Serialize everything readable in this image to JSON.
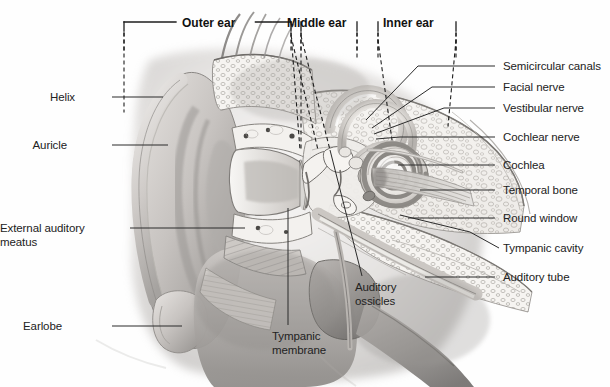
{
  "figure": {
    "background_color": "#fefefe",
    "ink_color": "#222222",
    "line_color": "#3a3a3a"
  },
  "brackets": [
    {
      "id": "outer-ear",
      "label": "Outer ear",
      "x1": 124,
      "x2": 291,
      "label_x": 182,
      "label_y": 16
    },
    {
      "id": "middle-ear",
      "label": "Middle ear",
      "x1": 301,
      "x2": 357,
      "label_x": 287,
      "label_y": 16
    },
    {
      "id": "inner-ear",
      "label": "Inner ear",
      "x1": 378,
      "x2": 456,
      "label_x": 383,
      "label_y": 16
    }
  ],
  "labels_left": [
    {
      "id": "helix",
      "text": "Helix",
      "text_x": 75,
      "text_y": 91,
      "lead_x1": 112,
      "lead_y1": 97,
      "lead_x2": 163,
      "lead_y2": 97
    },
    {
      "id": "auricle",
      "text": "Auricle",
      "text_x": 67,
      "text_y": 139,
      "lead_x1": 112,
      "lead_y1": 145,
      "lead_x2": 168,
      "lead_y2": 145
    },
    {
      "id": "external-auditory-meatus",
      "text": "External auditory\nmeatus",
      "text_x": 22,
      "text_y": 222,
      "lead_x1": 130,
      "lead_y1": 228,
      "lead_x2": 245,
      "lead_y2": 228
    },
    {
      "id": "earlobe",
      "text": "Earlobe",
      "text_x": 62,
      "text_y": 320,
      "lead_x1": 112,
      "lead_y1": 326,
      "lead_x2": 182,
      "lead_y2": 326
    }
  ],
  "labels_right": [
    {
      "id": "semicircular-canals",
      "text": "Semicircular canals",
      "text_x": 503,
      "text_y": 60,
      "lead_x1": 495,
      "lead_y1": 66,
      "lead_x2": 418,
      "lead_y2": 66,
      "lead_x3": 366,
      "lead_y3": 120
    },
    {
      "id": "facial-nerve",
      "text": "Facial nerve",
      "text_x": 503,
      "text_y": 81,
      "lead_x1": 495,
      "lead_y1": 87,
      "lead_x2": 432,
      "lead_y2": 87,
      "lead_x3": 372,
      "lead_y3": 128
    },
    {
      "id": "vestibular-nerve",
      "text": "Vestibular nerve",
      "text_x": 503,
      "text_y": 102,
      "lead_x1": 495,
      "lead_y1": 108,
      "lead_x2": 444,
      "lead_y2": 108,
      "lead_x3": 374,
      "lead_y3": 134
    },
    {
      "id": "cochlear-nerve",
      "text": "Cochlear nerve",
      "text_x": 503,
      "text_y": 131,
      "lead_x1": 495,
      "lead_y1": 137,
      "lead_x2": 400,
      "lead_y2": 137,
      "lead_x3": 376,
      "lead_y3": 139
    },
    {
      "id": "cochlea",
      "text": "Cochlea",
      "text_x": 503,
      "text_y": 159,
      "lead_x1": 495,
      "lead_y1": 165,
      "lead_x2": 398,
      "lead_y2": 165,
      "lead_x3": 398,
      "lead_y3": 165
    },
    {
      "id": "temporal-bone",
      "text": "Temporal bone",
      "text_x": 503,
      "text_y": 184,
      "lead_x1": 495,
      "lead_y1": 190,
      "lead_x2": 420,
      "lead_y2": 190,
      "lead_x3": 420,
      "lead_y3": 190
    },
    {
      "id": "round-window",
      "text": "Round window",
      "text_x": 503,
      "text_y": 212,
      "lead_x1": 495,
      "lead_y1": 218,
      "lead_x2": 408,
      "lead_y2": 218,
      "lead_x3": 408,
      "lead_y3": 218
    },
    {
      "id": "tympanic-cavity",
      "text": "Tympanic cavity",
      "text_x": 503,
      "text_y": 242,
      "lead_x1": 499,
      "lead_y1": 248,
      "lead_x2": 470,
      "lead_y2": 232,
      "lead_x3": 400,
      "lead_y3": 215
    },
    {
      "id": "auditory-tube",
      "text": "Auditory tube",
      "text_x": 503,
      "text_y": 271,
      "lead_x1": 495,
      "lead_y1": 277,
      "lead_x2": 425,
      "lead_y2": 277,
      "lead_x3": 425,
      "lead_y3": 277
    }
  ],
  "labels_bottom": [
    {
      "id": "tympanic-membrane",
      "text": "Tympanic\nmembrane",
      "text_x": 272,
      "text_y": 330,
      "lead_x1": 288,
      "lead_y1": 325,
      "lead_x2": 288,
      "lead_y2": 208
    },
    {
      "id": "auditory-ossicles",
      "text": "Auditory\nossicles",
      "text_x": 355,
      "text_y": 281,
      "lead_x1": 362,
      "lead_y1": 276,
      "lead_x2": 330,
      "lead_y2": 150
    }
  ],
  "structures": [
    {
      "id": "auricle",
      "name": "Auricle (pinna)"
    },
    {
      "id": "helix",
      "name": "Helix"
    },
    {
      "id": "earlobe",
      "name": "Earlobe"
    },
    {
      "id": "ear-canal",
      "name": "External auditory meatus"
    },
    {
      "id": "tympanic-membrane",
      "name": "Tympanic membrane"
    },
    {
      "id": "ossicles",
      "name": "Auditory ossicles"
    },
    {
      "id": "cochlea",
      "name": "Cochlea"
    },
    {
      "id": "semicircular-canals",
      "name": "Semicircular canals"
    },
    {
      "id": "vestibulocochlear-nerve",
      "name": "Vestibulocochlear nerve bundle"
    },
    {
      "id": "temporal-bone",
      "name": "Temporal bone"
    },
    {
      "id": "auditory-tube",
      "name": "Auditory tube"
    }
  ]
}
